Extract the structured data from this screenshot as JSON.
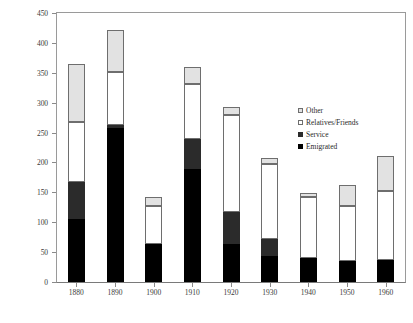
{
  "chart_data": {
    "type": "bar",
    "stacked": true,
    "title": "",
    "subtitle": "",
    "xlabel": "",
    "ylabel": "",
    "grid": false,
    "legend_position": "inside-right",
    "categories": [
      "1880",
      "1890",
      "1900",
      "1910",
      "1920",
      "1930",
      "1940",
      "1950",
      "1960"
    ],
    "ylim": [
      0,
      450
    ],
    "yticks": [
      0,
      50,
      100,
      150,
      200,
      250,
      300,
      350,
      400,
      450
    ],
    "ytick_labels": [
      "0",
      "50",
      "100",
      "150",
      "200",
      "250",
      "300",
      "350",
      "400",
      "450"
    ],
    "series": [
      {
        "name": "Emigrated",
        "color": "#000000",
        "values": [
          105,
          258,
          64,
          189,
          63,
          44,
          40,
          35,
          36
        ]
      },
      {
        "name": "Service",
        "color": "#2b2b2b",
        "values": [
          62,
          5,
          0,
          51,
          54,
          28,
          0,
          0,
          0
        ]
      },
      {
        "name": "Relatives/Friends",
        "color": "#ffffff",
        "values": [
          100,
          88,
          64,
          92,
          163,
          126,
          103,
          93,
          116
        ]
      },
      {
        "name": "Other",
        "color": "#e2e2e2",
        "values": [
          98,
          71,
          15,
          27,
          12,
          10,
          6,
          34,
          58
        ]
      }
    ],
    "totals": [
      365,
      422,
      143,
      359,
      292,
      208,
      149,
      162,
      210
    ]
  },
  "legend": {
    "entries": [
      {
        "label": "Other",
        "swatch": "other"
      },
      {
        "label": "Relatives/Friends",
        "swatch": "relatives"
      },
      {
        "label": "Service",
        "swatch": "service"
      },
      {
        "label": "Emigrated",
        "swatch": "emigrated"
      }
    ]
  }
}
